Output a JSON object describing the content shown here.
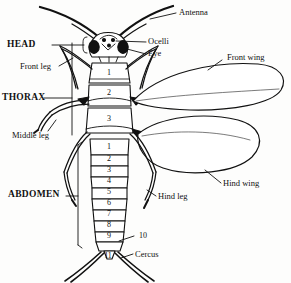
{
  "figure": {
    "background_color": "#fdfdfc",
    "ink_color": "#111111",
    "style": "black-and-white line drawing"
  },
  "labels": {
    "antenna": "Antenna",
    "head": "HEAD",
    "ocelli": "Ocelli",
    "eye": "Eye",
    "front_leg": "Front leg",
    "front_wing": "Front wing",
    "thorax": "THORAX",
    "middle_leg": "Middle leg",
    "hind_wing": "Hind wing",
    "abdomen": "ABDOMEN",
    "hind_leg": "Hind leg",
    "cercus": "Cercus"
  },
  "thorax_segments": [
    "1",
    "2",
    "3"
  ],
  "abdomen_segments": [
    "1",
    "2",
    "3",
    "4",
    "5",
    "6",
    "7",
    "8",
    "9"
  ],
  "terminal_segments": [
    "10",
    "11"
  ]
}
